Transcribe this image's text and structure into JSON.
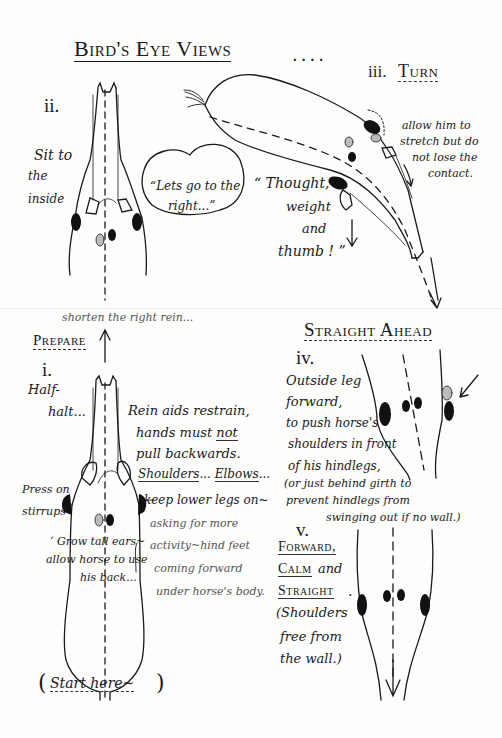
{
  "title": "Bird's Eye Views",
  "title_suffix": "....",
  "sections": {
    "ii": {
      "numeral": "ii.",
      "notes": [
        "Sit to",
        "the",
        "inside"
      ],
      "speech_bubble": [
        "“Lets go to the",
        "right...”"
      ]
    },
    "iii": {
      "numeral": "iii.",
      "heading": "Turn",
      "quote": [
        "“ Thought,",
        "weight",
        "and",
        "thumb ! ”"
      ],
      "note": [
        "allow him to",
        "stretch but do",
        "not lose the",
        "contact."
      ]
    },
    "prepare": {
      "heading": "Prepare",
      "arrow_note": "shorten the right rein..."
    },
    "i": {
      "numeral": "i.",
      "half_halt": [
        "Half-",
        "halt..."
      ],
      "rein_aids": [
        "Rein aids restrain,",
        "hands must ",
        "not",
        "pull backwards.",
        "Shoulders",
        "...",
        "Elbows",
        "..."
      ],
      "legs": [
        "keep lower legs on~",
        "asking for more",
        "activity~hind feet",
        "coming forward",
        "under horse's body."
      ],
      "press": [
        "Press on",
        "stirrups"
      ],
      "grow_tall": [
        "‘ Grow tall ears~",
        "allow horse to use",
        "his back..."
      ],
      "start": [
        "(",
        "Start   here~",
        ")"
      ]
    },
    "straight_ahead": {
      "heading": "Straight Ahead"
    },
    "iv": {
      "numeral": "iv.",
      "notes": [
        "Outside leg",
        "forward,",
        "to push horse's",
        "shoulders in front",
        "of his hindlegs,",
        "(or just behind girth to",
        "prevent hindlegs from",
        "swinging out if no wall.)"
      ]
    },
    "v": {
      "numeral": "v.",
      "words": [
        "Forward,",
        "Calm",
        "and",
        "Straight",
        "."
      ],
      "notes": [
        "(Shoulders",
        "free from",
        "the wall.)"
      ]
    }
  },
  "colors": {
    "ink": "#1a1a1a",
    "paper": "#fdfdfb",
    "pencil": "#555555"
  }
}
